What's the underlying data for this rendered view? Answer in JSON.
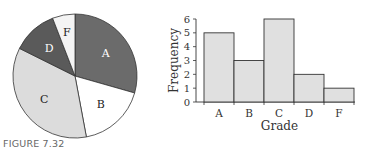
{
  "caption": "FIGURE 7.32",
  "colors": {
    "A": "#6b6b6b",
    "B": "#ffffff",
    "C": "#dcdcdc",
    "D": "#5a5a5a",
    "F": "#f4f4f4",
    "bar_fill": "#e0e0e0",
    "stroke": "#333333"
  },
  "chart_data": [
    {
      "type": "pie",
      "title": "",
      "categories": [
        "A",
        "B",
        "C",
        "D",
        "F"
      ],
      "values": [
        5,
        3,
        6,
        2,
        1
      ],
      "labels": [
        "A",
        "B",
        "C",
        "D",
        "F"
      ]
    },
    {
      "type": "bar",
      "title": "",
      "xlabel": "Grade",
      "ylabel": "Frequency",
      "categories": [
        "A",
        "B",
        "C",
        "D",
        "F"
      ],
      "values": [
        5,
        3,
        6,
        2,
        1
      ],
      "ylim": [
        0,
        6
      ],
      "yticks": [
        0,
        1,
        2,
        3,
        4,
        5,
        6
      ],
      "grid": false,
      "legend": null
    }
  ]
}
